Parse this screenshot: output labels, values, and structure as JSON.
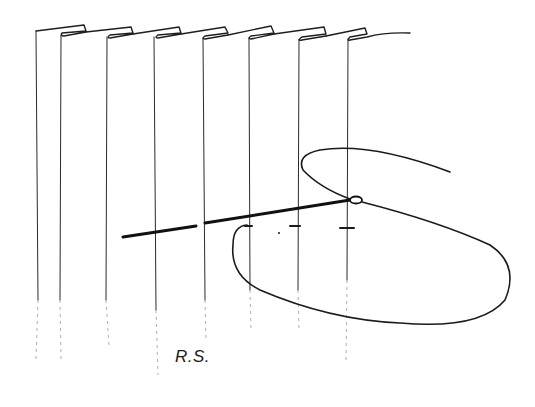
{
  "figure": {
    "label": "R.S.",
    "pleat_count": 7,
    "stitch_marks": 4,
    "colors": {
      "ink": "#1a1a1a",
      "background": "#ffffff"
    }
  }
}
